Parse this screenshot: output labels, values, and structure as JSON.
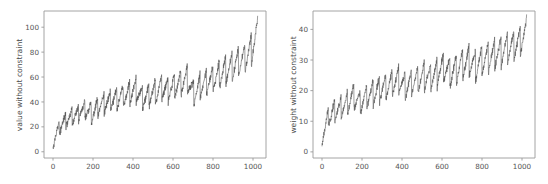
{
  "figure": {
    "background_color": "#ffffff",
    "width": 548,
    "height": 184
  },
  "chart_data": [
    {
      "type": "line",
      "panel": "left",
      "title": "",
      "xlabel": "",
      "ylabel": "value without constraint",
      "xlim": [
        -45,
        1065
      ],
      "ylim": [
        -5,
        113
      ],
      "xticks": [
        0,
        200,
        400,
        600,
        800,
        1000
      ],
      "yticks": [
        0,
        20,
        40,
        60,
        80,
        100
      ],
      "xticklabels": [
        "0",
        "200",
        "400",
        "600",
        "800",
        "1000"
      ],
      "yticklabels": [
        "0",
        "20",
        "40",
        "60",
        "80",
        "100"
      ],
      "grid": false,
      "legend": null,
      "line_color": "#4d4d4d",
      "description": "Dense sawtooth series: values rise with a noisy upward trend from about 2 at x=0 to about 108 at x=1023, overlaid with ~32 repeating sawtooth cycles of roughly 32 samples each that ramp up then drop sharply.",
      "n_points": 1024,
      "series": [
        {
          "name": "value without constraint",
          "trend_start": 2,
          "trend_end": 108,
          "sawtooth_period": 32,
          "sawtooth_amplitude_start": 14,
          "sawtooth_amplitude_end": 26,
          "noise_amplitude": 5,
          "sample_x": [
            0,
            32,
            64,
            96,
            128,
            160,
            192,
            224,
            256,
            288,
            320,
            352,
            384,
            416,
            448,
            480,
            512,
            544,
            576,
            608,
            640,
            672,
            704,
            736,
            768,
            800,
            832,
            864,
            896,
            928,
            960,
            992,
            1023
          ],
          "sample_peak_values": [
            12,
            27,
            31,
            34,
            38,
            42,
            40,
            44,
            47,
            49,
            52,
            54,
            57,
            60,
            52,
            55,
            58,
            62,
            59,
            63,
            66,
            70,
            56,
            63,
            67,
            69,
            73,
            77,
            80,
            84,
            88,
            95,
            108
          ],
          "sample_trough_values": [
            2,
            14,
            20,
            22,
            25,
            27,
            22,
            29,
            31,
            33,
            34,
            36,
            38,
            40,
            33,
            36,
            38,
            42,
            40,
            43,
            45,
            47,
            37,
            43,
            46,
            48,
            51,
            54,
            57,
            60,
            64,
            70,
            82
          ]
        }
      ]
    },
    {
      "type": "line",
      "panel": "right",
      "title": "",
      "xlabel": "",
      "ylabel": "weight without constraint",
      "xlim": [
        -45,
        1065
      ],
      "ylim": [
        -2,
        46
      ],
      "xticks": [
        0,
        200,
        400,
        600,
        800,
        1000
      ],
      "yticks": [
        0,
        10,
        20,
        30,
        40
      ],
      "xticklabels": [
        "0",
        "200",
        "400",
        "600",
        "800",
        "1000"
      ],
      "yticklabels": [
        "0",
        "10",
        "20",
        "30",
        "40"
      ],
      "grid": false,
      "legend": null,
      "line_color": "#4d4d4d",
      "description": "Dense sawtooth series: weights rise with a noisy upward trend from about 2 at x=0 to about 44 at x=1023, overlaid with ~32 repeating sawtooth cycles of roughly 32 samples each that ramp up then drop sharply.",
      "n_points": 1024,
      "series": [
        {
          "name": "weight without constraint",
          "trend_start": 2,
          "trend_end": 44,
          "sawtooth_period": 32,
          "sawtooth_amplitude_start": 7,
          "sawtooth_amplitude_end": 10,
          "noise_amplitude": 2,
          "sample_x": [
            0,
            32,
            64,
            96,
            128,
            160,
            192,
            224,
            256,
            288,
            320,
            352,
            384,
            416,
            448,
            480,
            512,
            544,
            576,
            608,
            640,
            672,
            704,
            736,
            768,
            800,
            832,
            864,
            896,
            928,
            960,
            992,
            1023
          ],
          "sample_peak_values": [
            7,
            15,
            17,
            18,
            20,
            23,
            20,
            22,
            24,
            25,
            26,
            27,
            28,
            26,
            27,
            28,
            30,
            29,
            31,
            33,
            31,
            32,
            34,
            35,
            33,
            35,
            36,
            37,
            38,
            39,
            40,
            41,
            44
          ],
          "sample_trough_values": [
            2,
            8,
            10,
            11,
            12,
            14,
            12,
            14,
            15,
            16,
            17,
            18,
            19,
            17,
            18,
            19,
            20,
            20,
            21,
            23,
            21,
            22,
            24,
            25,
            23,
            25,
            26,
            27,
            28,
            29,
            30,
            31,
            35
          ]
        }
      ]
    }
  ]
}
